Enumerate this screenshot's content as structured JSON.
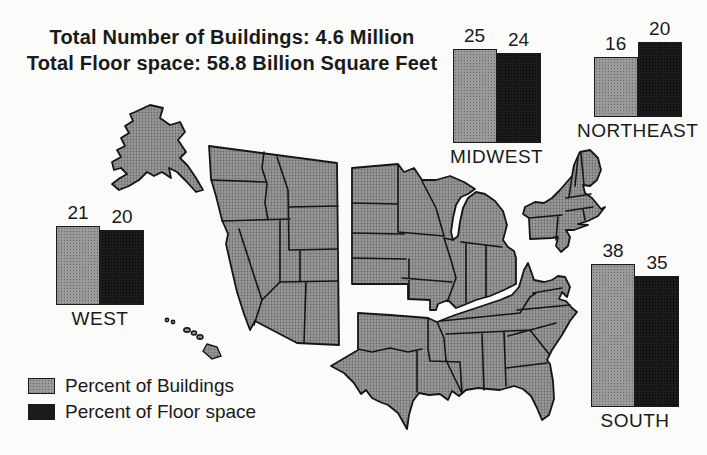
{
  "title": {
    "line1": "Total Number of Buildings: 4.6 Million",
    "line2": "Total Floor space: 58.8 Billion Square Feet"
  },
  "legend": {
    "items": [
      {
        "label": "Percent of Buildings",
        "color": "#9a9a9a"
      },
      {
        "label": "Percent of Floor space",
        "color": "#1b1b1b"
      }
    ]
  },
  "chart_data": {
    "type": "bar",
    "series": [
      {
        "name": "Percent of Buildings",
        "color": "#9a9a9a"
      },
      {
        "name": "Percent of Floor space",
        "color": "#1b1b1b"
      }
    ],
    "categories": [
      "MIDWEST",
      "NORTHEAST",
      "WEST",
      "SOUTH"
    ],
    "regions": [
      {
        "label": "MIDWEST",
        "buildings": 25,
        "floor_space": 24
      },
      {
        "label": "NORTHEAST",
        "buildings": 16,
        "floor_space": 20
      },
      {
        "label": "WEST",
        "buildings": 21,
        "floor_space": 20
      },
      {
        "label": "SOUTH",
        "buildings": 38,
        "floor_space": 35
      }
    ],
    "unit": "percent",
    "ylim": [
      0,
      40
    ],
    "scale_px_per_unit": 3.75,
    "totals": {
      "buildings": "4.6 Million",
      "floor_space": "58.8 Billion Square Feet"
    }
  },
  "map": {
    "name": "united-states-census-regions-exploded",
    "fill": "#989898",
    "stroke": "#151515",
    "regions": [
      "West",
      "Midwest",
      "Northeast",
      "South"
    ]
  }
}
